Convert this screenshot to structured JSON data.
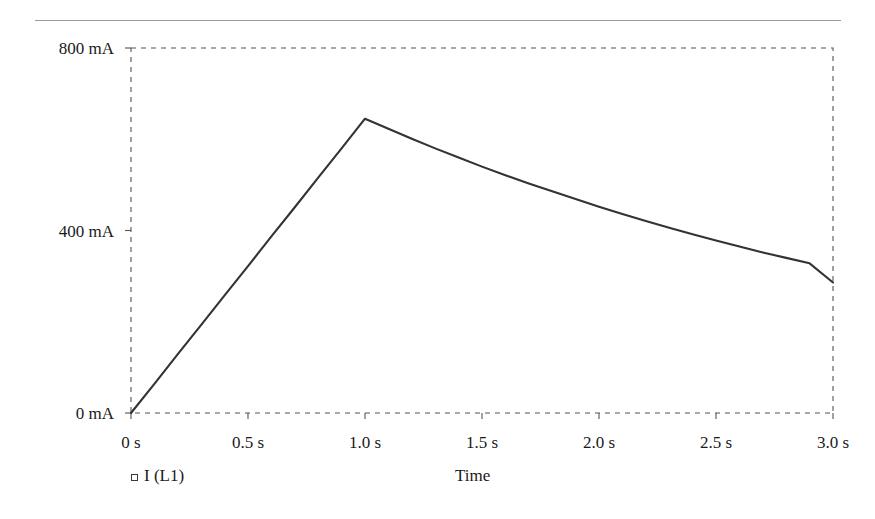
{
  "figure": {
    "has_top_rule": true,
    "background_color": "#ffffff",
    "line_color": "#333333",
    "frame_color": "#555555",
    "text_color": "#1a1a1a"
  },
  "legend": {
    "marker": "open-square-marker",
    "label": "I (L1)"
  },
  "axes": {
    "x_title": "Time",
    "y_title": ""
  },
  "chart_data": {
    "type": "line",
    "title": "",
    "subtitle": "",
    "xlabel": "Time",
    "ylabel": "",
    "xlim": [
      0,
      3.0
    ],
    "ylim": [
      0,
      800
    ],
    "grid": false,
    "frame_style": "dashed",
    "legend_position": "below-left",
    "x_tick_values": [
      0,
      0.5,
      1.0,
      1.5,
      2.0,
      2.5,
      3.0
    ],
    "x_tick_labels": [
      "0 s",
      "0.5 s",
      "1.0 s",
      "1.5 s",
      "2.0 s",
      "2.5 s",
      "3.0 s"
    ],
    "y_tick_values": [
      0,
      400,
      800
    ],
    "y_tick_labels": [
      "0 mA",
      "400 mA",
      "800 mA"
    ],
    "x_unit": "s",
    "y_unit": "mA",
    "series": [
      {
        "name": "I (L1)",
        "x": [
          0.0,
          0.1,
          0.2,
          0.3,
          0.4,
          0.5,
          0.6,
          0.7,
          0.8,
          0.9,
          1.0,
          1.1,
          1.2,
          1.3,
          1.4,
          1.5,
          1.6,
          1.7,
          1.8,
          1.9,
          2.0,
          2.1,
          2.2,
          2.3,
          2.4,
          2.5,
          2.6,
          2.7,
          2.8,
          2.9,
          3.0
        ],
        "values": [
          0,
          64,
          129,
          193,
          258,
          322,
          387,
          451,
          516,
          580,
          645,
          623,
          601,
          580,
          560,
          540,
          521,
          503,
          486,
          469,
          452,
          436,
          421,
          406,
          392,
          378,
          365,
          352,
          340,
          328,
          286
        ]
      }
    ],
    "annotations": []
  }
}
